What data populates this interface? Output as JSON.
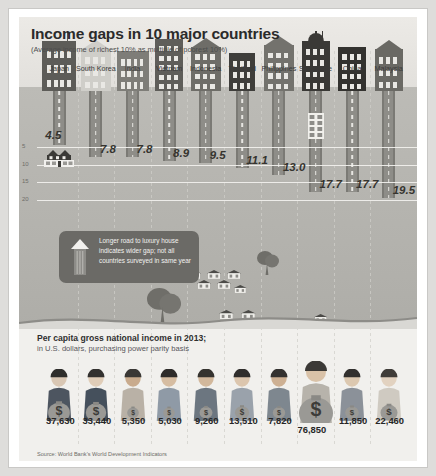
{
  "header": {
    "title": "Income gaps in 10 major countries",
    "subtitle": "(Average income of richest 10% as multiple of poorest 10%)"
  },
  "callout": {
    "text": "Longer road to luxury house indicates wider gap; not all countries surveyed in same year"
  },
  "lower": {
    "title": "Per capita gross national income in 2013;",
    "subtitle": "in U.S. dollars, purchasing power parity basis"
  },
  "source": "Source: World Bank's World Development Indicators",
  "axis": {
    "ticks": [
      "5",
      "10",
      "15",
      "20"
    ],
    "tick_values": [
      5,
      10,
      15,
      20
    ]
  },
  "colors": {
    "road": "#8e8d88",
    "panel_sky": "#e8e7e3",
    "panel_ground": "#b6b5b0",
    "callout_bg": "#6b6a66",
    "value_text": "#35342f",
    "lower_bg": "#f1f0ed",
    "money_bag": "#9a9995"
  },
  "chart_data": {
    "type": "bar",
    "title": "Income gaps in 10 major countries",
    "subtitle": "(Average income of richest 10% as multiple of poorest 10%)",
    "xlabel": "",
    "ylabel": "Income gap multiple",
    "ylim": [
      0,
      21
    ],
    "grid": true,
    "orientation": "vertical-descending-road",
    "categories": [
      "Japan",
      "South Korea",
      "India",
      "Vietnam",
      "Indonesia",
      "Thailand",
      "Philippines",
      "Singapore",
      "China",
      "Malaysia"
    ],
    "values": [
      4.5,
      7.8,
      7.8,
      8.9,
      9.5,
      11.1,
      13.0,
      17.7,
      17.7,
      19.5
    ],
    "value_labels": [
      "4.5",
      "7.8",
      "7.8",
      "8.9",
      "9.5",
      "11.1",
      "13.0",
      "17.7",
      "17.7",
      "19.5"
    ],
    "series": [
      {
        "name": "Per capita gross national income in 2013 (US$ PPP)",
        "values": [
          37630,
          33440,
          5350,
          5030,
          9260,
          13510,
          7820,
          76850,
          11850,
          22460
        ],
        "value_labels": [
          "37,630",
          "33,440",
          "5,350",
          "5,030",
          "9,260",
          "13,510",
          "7,820",
          "76,850",
          "11,850",
          "22,460"
        ]
      }
    ],
    "source": "Source: World Bank's World Development Indicators"
  },
  "countries": [
    {
      "name": "Japan",
      "gap": "4.5",
      "gni": "37,630"
    },
    {
      "name": "South Korea",
      "gap": "7.8",
      "gni": "33,440"
    },
    {
      "name": "India",
      "gap": "7.8",
      "gni": "5,350"
    },
    {
      "name": "Vietnam",
      "gap": "8.9",
      "gni": "5,030"
    },
    {
      "name": "Indonesia",
      "gap": "9.5",
      "gni": "9,260"
    },
    {
      "name": "Thailand",
      "gap": "11.1",
      "gni": "13,510"
    },
    {
      "name": "Philippines",
      "gap": "13.0",
      "gni": "7,820"
    },
    {
      "name": "Singapore",
      "gap": "17.7",
      "gni": "76,850"
    },
    {
      "name": "China",
      "gap": "17.7",
      "gni": "11,850"
    },
    {
      "name": "Malaysia",
      "gap": "19.5",
      "gni": "22,460"
    }
  ]
}
